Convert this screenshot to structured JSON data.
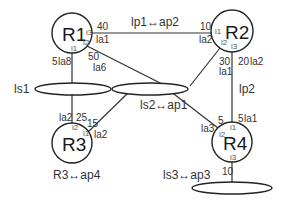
{
  "routers": [
    {
      "id": "R1",
      "label": "R1",
      "ifaces": {
        "i1": "i1",
        "i2": "i2",
        "i3": "i3"
      }
    },
    {
      "id": "R2",
      "label": "R2",
      "ifaces": {
        "i1": "i1",
        "i2": "i2",
        "i3": "i3"
      }
    },
    {
      "id": "R3",
      "label": "R3",
      "ifaces": {
        "i1": "i1",
        "i2": "i2"
      }
    },
    {
      "id": "R4",
      "label": "R4",
      "ifaces": {
        "i1": "i1",
        "i2": "i2",
        "i3": "i3"
      }
    }
  ],
  "segments": [
    {
      "id": "ls1",
      "label": "ls1"
    },
    {
      "id": "ls2",
      "label": "ls2↔ap1"
    },
    {
      "id": "ls3",
      "label": "ls3↔ap3"
    }
  ],
  "links": {
    "lp1": {
      "label": "lp1↔ap2",
      "r1_cost": "40",
      "r1_area": "la1",
      "r2_cost": "10",
      "r2_area": "la2"
    },
    "lp2": {
      "label": "lp2",
      "r2_cost": "20",
      "r2_area": "la2",
      "r4_cost": "5",
      "r4_area": "la1"
    },
    "r1_ls1": {
      "cost": "5",
      "area": "la8"
    },
    "r1_ls2": {
      "cost": "50",
      "area": "la6"
    },
    "r2_ls2": {
      "cost": "30",
      "area": "la1"
    },
    "r3_ls1": {
      "cost": "25",
      "area": "la2"
    },
    "r3_ls2": {
      "cost": "15",
      "area": "la2"
    },
    "r4_ls2": {
      "cost": "5",
      "area": "la3"
    },
    "r4_ls3": {
      "cost": "10"
    }
  },
  "annotations": {
    "r3_caption": "R3↔ap4"
  }
}
